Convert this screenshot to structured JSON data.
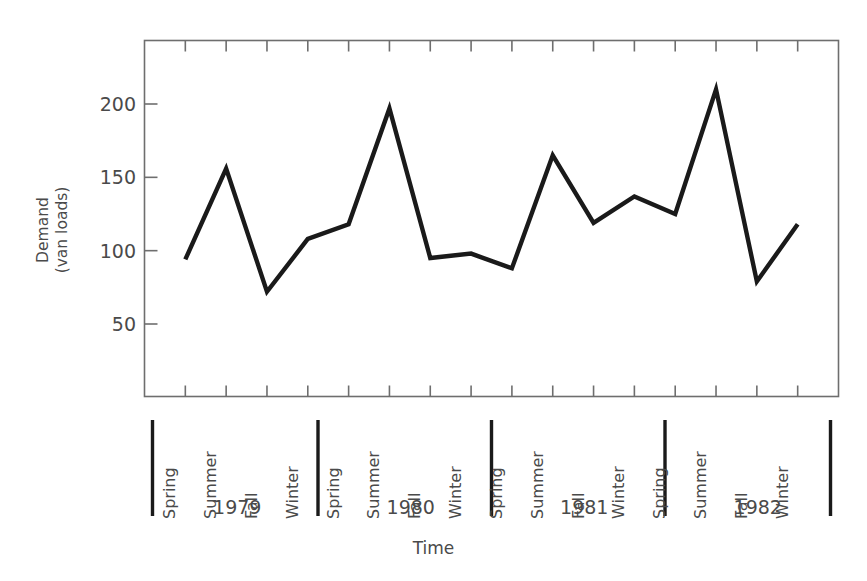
{
  "chart_data": {
    "type": "line",
    "title": "",
    "xlabel": "Time",
    "ylabel_lines": [
      "Demand",
      "(van loads)"
    ],
    "ylabel": "Demand (van loads)",
    "ylim": [
      0,
      235
    ],
    "yticks": [
      50,
      100,
      150,
      200
    ],
    "ytick_labels": [
      "50",
      "100",
      "150",
      "200"
    ],
    "grid": false,
    "legend": "none",
    "line_color": "#1a1a1a",
    "axis_color": "#6e6e6e",
    "categories": [
      "Spring 1979",
      "Summer 1979",
      "Fall 1979",
      "Winter 1979",
      "Spring 1980",
      "Summer 1980",
      "Fall 1980",
      "Winter 1980",
      "Spring 1981",
      "Summer 1981",
      "Fall 1981",
      "Winter 1981",
      "Spring 1982",
      "Summer 1982",
      "Fall 1982",
      "Winter 1982"
    ],
    "seasons": [
      "Spring",
      "Summer",
      "Fall",
      "Winter"
    ],
    "years": [
      "1979",
      "1980",
      "1981",
      "1982"
    ],
    "values": [
      94,
      156,
      72,
      108,
      118,
      197,
      95,
      98,
      88,
      165,
      119,
      137,
      125,
      210,
      79,
      118
    ],
    "series": [
      {
        "name": "Demand",
        "values": [
          94,
          156,
          72,
          108,
          118,
          197,
          95,
          98,
          88,
          165,
          119,
          137,
          125,
          210,
          79,
          118
        ]
      }
    ],
    "points": [
      {
        "label": "Spring 1979",
        "season": "Spring",
        "year": "1979",
        "value": 94
      },
      {
        "label": "Summer 1979",
        "season": "Summer",
        "year": "1979",
        "value": 156
      },
      {
        "label": "Fall 1979",
        "season": "Fall",
        "year": "1979",
        "value": 72
      },
      {
        "label": "Winter 1979",
        "season": "Winter",
        "year": "1979",
        "value": 108
      },
      {
        "label": "Spring 1980",
        "season": "Spring",
        "year": "1980",
        "value": 118
      },
      {
        "label": "Summer 1980",
        "season": "Summer",
        "year": "1980",
        "value": 197
      },
      {
        "label": "Fall 1980",
        "season": "Fall",
        "year": "1980",
        "value": 95
      },
      {
        "label": "Winter 1980",
        "season": "Winter",
        "year": "1980",
        "value": 98
      },
      {
        "label": "Spring 1981",
        "season": "Spring",
        "year": "1981",
        "value": 88
      },
      {
        "label": "Summer 1981",
        "season": "Summer",
        "year": "1981",
        "value": 165
      },
      {
        "label": "Fall 1981",
        "season": "Fall",
        "year": "1981",
        "value": 119
      },
      {
        "label": "Winter 1981",
        "season": "Winter",
        "year": "1981",
        "value": 137
      },
      {
        "label": "Spring 1982",
        "season": "Spring",
        "year": "1982",
        "value": 125
      },
      {
        "label": "Summer 1982",
        "season": "Summer",
        "year": "1982",
        "value": 210
      },
      {
        "label": "Fall 1982",
        "season": "Fall",
        "year": "1982",
        "value": 79
      },
      {
        "label": "Winter 1982",
        "season": "Winter",
        "year": "1982",
        "value": 118
      }
    ]
  }
}
